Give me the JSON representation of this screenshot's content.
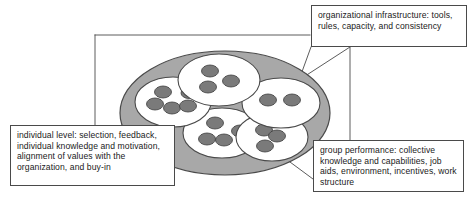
{
  "figure": {
    "type": "concentric-levels-diagram"
  },
  "colors": {
    "organization_fill": "#a8a8a8",
    "organization_stroke": "#4a4a4a",
    "group_fill": "#ffffff",
    "group_stroke": "#4a4a4a",
    "individual_fill": "#7a7a7a",
    "individual_stroke": "#3c3c3c",
    "callout_border": "#4a4a4a",
    "callout_fill": "#ffffff",
    "leader_line": "#4a4a4a",
    "text": "#1a1a1a",
    "page_background": "#ffffff"
  },
  "callouts": {
    "organization": {
      "name": "organizational infrastructure",
      "text": "organizational infrastructure: tools, rules, capacity, and consistency"
    },
    "individual": {
      "name": "individual level",
      "text": "individual level: selection, feedback, individual knowledge and motivation, alignment of values with the organization, and buy-in"
    },
    "group": {
      "name": "group performance",
      "text": "group performance: collective knowledge and capabilities, job aids, environment, incentives, work structure"
    }
  },
  "diagram": {
    "organization_ellipse": {
      "cx": 225,
      "cy": 113,
      "rx": 105,
      "ry": 62
    },
    "groups": [
      {
        "id": "group-top",
        "label": "top group",
        "cx": 219,
        "cy": 80,
        "rx": 41,
        "ry": 26,
        "individuals": [
          {
            "cx": 210,
            "cy": 71,
            "rx": 8.5,
            "ry": 6
          },
          {
            "cx": 231,
            "cy": 81,
            "rx": 8.5,
            "ry": 6
          },
          {
            "cx": 208,
            "cy": 87,
            "rx": 8.5,
            "ry": 6
          }
        ]
      },
      {
        "id": "group-left",
        "label": "left group",
        "cx": 173,
        "cy": 102,
        "rx": 38,
        "ry": 25,
        "individuals": [
          {
            "cx": 163,
            "cy": 92,
            "rx": 8.5,
            "ry": 6
          },
          {
            "cx": 189,
            "cy": 93,
            "rx": 8,
            "ry": 5.5
          },
          {
            "cx": 155,
            "cy": 104,
            "rx": 8.5,
            "ry": 6
          },
          {
            "cx": 172,
            "cy": 108,
            "rx": 8.5,
            "ry": 6
          },
          {
            "cx": 188,
            "cy": 106,
            "rx": 8.5,
            "ry": 6
          }
        ]
      },
      {
        "id": "group-right",
        "label": "right group",
        "cx": 281,
        "cy": 103,
        "rx": 39,
        "ry": 25,
        "individuals": [
          {
            "cx": 268,
            "cy": 100,
            "rx": 8.5,
            "ry": 6
          },
          {
            "cx": 292,
            "cy": 100,
            "rx": 8.5,
            "ry": 6
          }
        ]
      },
      {
        "id": "group-bottom-center",
        "label": "bottom center group",
        "cx": 222,
        "cy": 133,
        "rx": 39,
        "ry": 25,
        "individuals": [
          {
            "cx": 215,
            "cy": 123,
            "rx": 8.5,
            "ry": 6
          },
          {
            "cx": 240,
            "cy": 131,
            "rx": 8.5,
            "ry": 6
          },
          {
            "cx": 207,
            "cy": 139,
            "rx": 8.5,
            "ry": 6
          },
          {
            "cx": 224,
            "cy": 140,
            "rx": 8.5,
            "ry": 6
          }
        ]
      },
      {
        "id": "group-bottom-right",
        "label": "bottom right group",
        "cx": 272,
        "cy": 137,
        "rx": 36,
        "ry": 24,
        "individuals": [
          {
            "cx": 264,
            "cy": 130,
            "rx": 8.5,
            "ry": 6
          },
          {
            "cx": 277,
            "cy": 136,
            "rx": 8.5,
            "ry": 6
          },
          {
            "cx": 265,
            "cy": 146,
            "rx": 8.5,
            "ry": 6
          }
        ]
      }
    ],
    "leader_lines": [
      {
        "id": "leader-org-frame-top",
        "points": "95,35 310,35"
      },
      {
        "id": "leader-org-frame-left",
        "points": "95,35 95,125"
      },
      {
        "id": "leader-org-a",
        "points": "311,47 300,79"
      },
      {
        "id": "leader-org-b",
        "points": "350,47 300,79"
      },
      {
        "id": "leader-org-down",
        "points": "350,47 350,140"
      },
      {
        "id": "leader-individual",
        "points": "175,131 156,103"
      },
      {
        "id": "leader-group",
        "points": "313,178 272,148"
      }
    ]
  }
}
